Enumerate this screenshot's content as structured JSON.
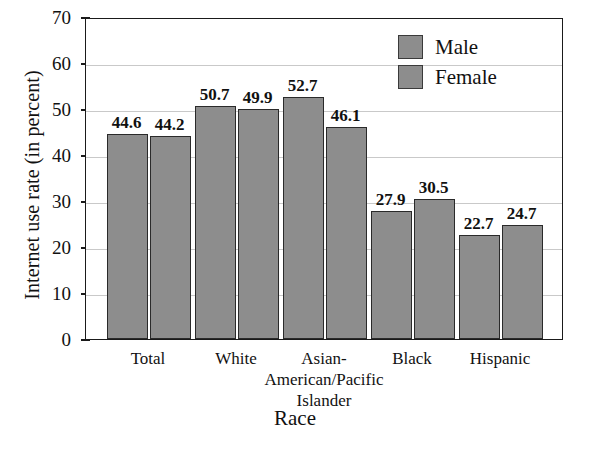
{
  "chart_data": {
    "type": "bar",
    "title": "",
    "xlabel": "Race",
    "ylabel": "Internet use rate (in percent)",
    "categories": [
      "Total",
      "White",
      "Asian-\nAmerican/Pacific\nIslander",
      "Black",
      "Hispanic"
    ],
    "series": [
      {
        "name": "Male",
        "values": [
          44.6,
          50.7,
          52.7,
          27.9,
          22.7
        ]
      },
      {
        "name": "Female",
        "values": [
          44.2,
          49.9,
          46.1,
          30.5,
          24.7
        ]
      }
    ],
    "ylim": [
      0,
      70
    ],
    "yticks": [
      0,
      10,
      20,
      30,
      40,
      50,
      60,
      70
    ],
    "ytick_labels": [
      "0",
      "10",
      "20",
      "30",
      "40",
      "50",
      "60",
      "70"
    ],
    "grid": true,
    "legend_position": "top-right",
    "bar_color": "#8d8d8d",
    "bar_edge_color": "#2a2a2a",
    "grid_color": "#c9c9c9",
    "axis_color": "#1a1a1a",
    "text_color": "#111111"
  },
  "legend": {
    "entries": [
      {
        "label": "Male"
      },
      {
        "label": "Female"
      }
    ]
  }
}
